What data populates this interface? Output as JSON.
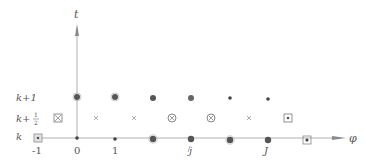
{
  "diagram": {
    "axes": {
      "vertical_label": "t",
      "horizontal_label": "φ",
      "color": "#9a9a9a"
    },
    "row_labels": [
      {
        "text": "k+1",
        "y": 97
      },
      {
        "text": "k+½",
        "y": 118
      },
      {
        "text": "k",
        "y": 138
      }
    ],
    "row_label_parts": {
      "k1_main": "k+1",
      "khalf_main": "k+",
      "khalf_num": "1",
      "khalf_den": "2",
      "k_main": "k"
    },
    "column_labels": [
      {
        "text": "-1",
        "x": 38
      },
      {
        "text": "0",
        "x": 77
      },
      {
        "text": "1",
        "x": 115
      },
      {
        "text": "j",
        "x": 191
      },
      {
        "text": "J",
        "x": 268
      }
    ],
    "marker_legend": {
      "large_dot": "large filled circle",
      "small_dot": "small filled dot",
      "cross": "×",
      "circled_cross": "⊗",
      "boxed_cross": "⊠",
      "boxed_dot": "⊡"
    },
    "markers": {
      "row_k_plus_1": [
        {
          "x": 77,
          "type": "large_dot"
        },
        {
          "x": 115,
          "type": "large_dot"
        },
        {
          "x": 153,
          "type": "large_dot"
        },
        {
          "x": 191,
          "type": "large_dot"
        },
        {
          "x": 230,
          "type": "small_dot"
        },
        {
          "x": 268,
          "type": "small_dot"
        }
      ],
      "row_k_plus_half": [
        {
          "x": 58,
          "type": "boxed_cross"
        },
        {
          "x": 96,
          "type": "cross"
        },
        {
          "x": 134,
          "type": "cross"
        },
        {
          "x": 172,
          "type": "circled_cross"
        },
        {
          "x": 211,
          "type": "circled_cross"
        },
        {
          "x": 249,
          "type": "cross"
        },
        {
          "x": 288,
          "type": "boxed_dot"
        }
      ],
      "row_k": [
        {
          "x": 38,
          "type": "boxed_dot"
        },
        {
          "x": 77,
          "type": "small_dot"
        },
        {
          "x": 115,
          "type": "small_dot"
        },
        {
          "x": 153,
          "type": "large_dot"
        },
        {
          "x": 191,
          "type": "large_dot"
        },
        {
          "x": 230,
          "type": "large_dot"
        },
        {
          "x": 268,
          "type": "large_dot"
        },
        {
          "x": 307,
          "type": "boxed_dot"
        }
      ]
    },
    "colors": {
      "marker": "#555555",
      "marker_light": "#888888",
      "axis": "#9a9a9a"
    }
  }
}
